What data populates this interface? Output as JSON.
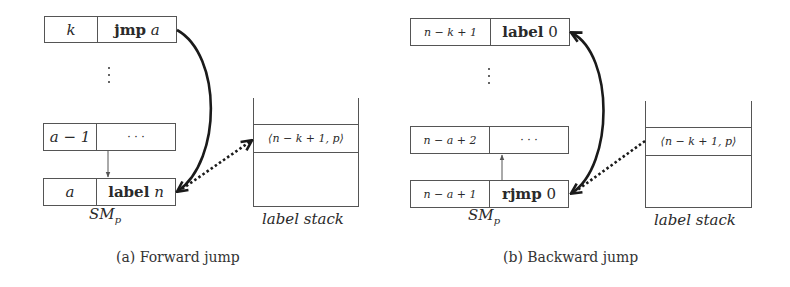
{
  "panel_a": {
    "rows": [
      {
        "index": "k",
        "instr_bold": "jmp",
        "instr_arg": "a"
      },
      {
        "index": "a − 1",
        "instr_bold": "",
        "instr_arg": "· · ·"
      },
      {
        "index": "a",
        "instr_bold": "label",
        "instr_arg": "n"
      }
    ],
    "vdots": "⋮",
    "memory_label_main": "SM",
    "memory_label_sub": "p",
    "stack_entry": "⟨n − k + 1, p⟩",
    "stack_label": "label stack",
    "caption": "(a) Forward jump"
  },
  "panel_b": {
    "rows": [
      {
        "index": "n − k + 1",
        "instr_bold": "label",
        "instr_arg": "0"
      },
      {
        "index": "n − a + 2",
        "instr_bold": "",
        "instr_arg": "· · ·"
      },
      {
        "index": "n − a + 1",
        "instr_bold": "rjmp",
        "instr_arg": "0"
      }
    ],
    "vdots": "⋮",
    "memory_label_main": "SM",
    "memory_label_sub": "p",
    "stack_entry": "⟨n − k + 1, p⟩",
    "stack_label": "label stack",
    "caption": "(b) Backward jump"
  },
  "colors": {
    "line": "#555555",
    "arrow": "#1a1a1a",
    "text": "#2a2a2a"
  }
}
